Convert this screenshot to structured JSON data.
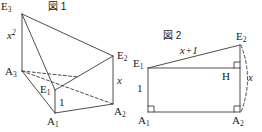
{
  "figure1": {
    "title": "図 1",
    "labels": {
      "e3": "E",
      "e3_sub": "3",
      "e2": "E",
      "e2_sub": "2",
      "e1": "E",
      "e1_sub": "1",
      "a3": "A",
      "a3_sub": "3",
      "a2": "A",
      "a2_sub": "2",
      "a1": "A",
      "a1_sub": "1",
      "edge_x_squared": "x",
      "edge_x_squared_exp": "2",
      "edge_x": "x",
      "edge_one": "1"
    }
  },
  "figure2": {
    "title": "図 2",
    "labels": {
      "e1": "E",
      "e1_sub": "1",
      "e2": "E",
      "e2_sub": "2",
      "a1": "A",
      "a1_sub": "1",
      "a2": "A",
      "a2_sub": "2",
      "h": "H",
      "edge_x_plus_one": "x+1",
      "edge_one": "1",
      "edge_x": "x"
    }
  },
  "style": {
    "line_color": "#3a3a3a",
    "background": "#ffffff",
    "text_color": "#1a1a1a"
  }
}
